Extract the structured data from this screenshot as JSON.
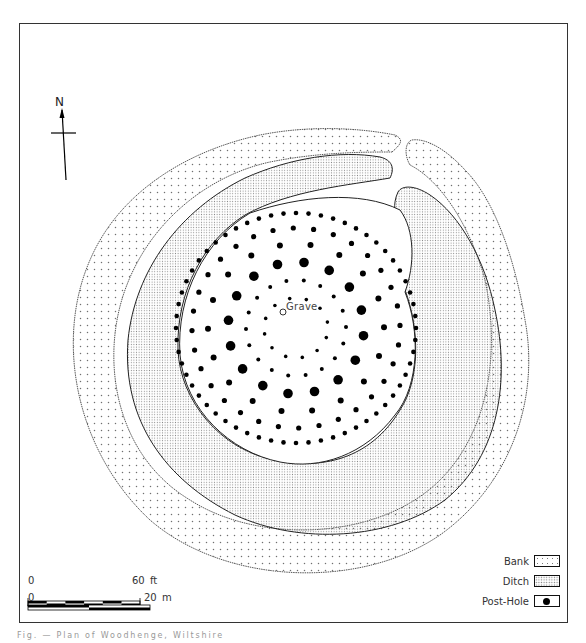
{
  "figure": {
    "caption": "Fig. — Plan of Woodhenge, Wiltshire",
    "north_label": "N",
    "center_label": "Grave"
  },
  "legend": {
    "items": [
      {
        "label": "Bank",
        "pattern": "sparse-dots"
      },
      {
        "label": "Ditch",
        "pattern": "dense-stipple"
      },
      {
        "label": "Post-Hole",
        "pattern": "filled-circle"
      }
    ]
  },
  "scale_bar": {
    "feet": {
      "start": "0",
      "end": "60",
      "unit": "ft",
      "segments": 6
    },
    "metres": {
      "start": "0",
      "end": "20",
      "unit": "m",
      "segments": 2
    }
  },
  "colors": {
    "ink": "#000000",
    "outline": "#333333",
    "bank_dots": "#777777",
    "ditch_stipple": "#888888",
    "paper": "#ffffff"
  },
  "post_hole_rings": [
    {
      "ring": "A",
      "rx": 120,
      "ry": 115,
      "count": 60,
      "size": 2.3
    },
    {
      "ring": "B",
      "rx": 104,
      "ry": 100,
      "count": 32,
      "size": 2.6
    },
    {
      "ring": "C",
      "rx": 88,
      "ry": 84,
      "count": 18,
      "size": 3.0
    },
    {
      "ring": "D",
      "rx": 68,
      "ry": 66,
      "count": 16,
      "size": 4.8
    },
    {
      "ring": "E",
      "rx": 50,
      "ry": 48,
      "count": 18,
      "size": 2.0
    },
    {
      "ring": "F",
      "rx": 32,
      "ry": 30,
      "count": 12,
      "size": 1.8
    }
  ]
}
